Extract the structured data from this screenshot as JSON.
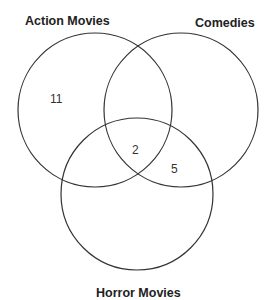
{
  "diagram": {
    "type": "venn-3",
    "sets": [
      {
        "id": "action",
        "label": "Action Movies",
        "cx": 95,
        "cy": 110,
        "r": 77
      },
      {
        "id": "comedies",
        "label": "Comedies",
        "cx": 181,
        "cy": 110,
        "r": 77
      },
      {
        "id": "horror",
        "label": "Horror Movies",
        "cx": 137,
        "cy": 194,
        "r": 76
      }
    ],
    "regions": [
      {
        "sets": [
          "action"
        ],
        "value": "11"
      },
      {
        "sets": [
          "action",
          "comedies",
          "horror"
        ],
        "value": "2"
      },
      {
        "sets": [
          "comedies",
          "horror"
        ],
        "value": "5"
      }
    ],
    "stroke_color": "#333333"
  }
}
